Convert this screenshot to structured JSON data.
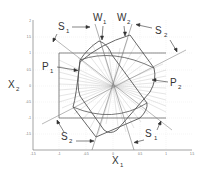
{
  "diagram": {
    "axes": {
      "x_label": "X",
      "x_label_sub": "1",
      "y_label": "X",
      "y_label_sub": "2",
      "x_ticks": [
        "-1.5",
        "-1",
        "-0.5",
        "0",
        "0.5",
        "1",
        "1.5"
      ],
      "y_ticks": [
        "2",
        "1.5",
        "1",
        "0.5",
        "0",
        "-0.5",
        "-1",
        "-1.5"
      ]
    },
    "annotations": [
      {
        "id": "s1-top",
        "main": "S",
        "sub": "1"
      },
      {
        "id": "w1",
        "main": "W",
        "sub": "1"
      },
      {
        "id": "w2",
        "main": "W",
        "sub": "2"
      },
      {
        "id": "s2-top",
        "main": "S",
        "sub": "2"
      },
      {
        "id": "p1",
        "main": "P",
        "sub": "1"
      },
      {
        "id": "p2",
        "main": "P",
        "sub": "2"
      },
      {
        "id": "s2-bottom",
        "main": "S",
        "sub": "2"
      },
      {
        "id": "s1-bottom",
        "main": "S",
        "sub": "1"
      }
    ],
    "colors": {
      "curve": "#555555",
      "grid": "#dddddd",
      "rays": "#999999",
      "axis": "#555555"
    }
  }
}
